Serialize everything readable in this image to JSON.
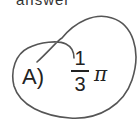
{
  "header_fragment": "answer",
  "choice": {
    "letter": "A)",
    "numerator": "1",
    "denominator": "3",
    "symbol": "π"
  },
  "annotation": "hand-drawn circle around choice A"
}
